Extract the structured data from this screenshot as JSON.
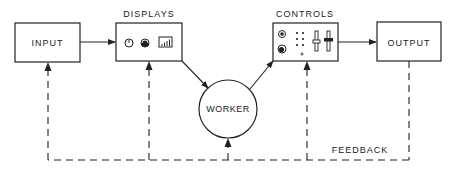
{
  "diagram": {
    "nodes": {
      "input": {
        "label": "INPUT"
      },
      "displays": {
        "label": "DISPLAYS",
        "icons": [
          "dial-gauge-icon",
          "meter-gauge-icon",
          "bar-graph-icon"
        ]
      },
      "worker": {
        "label": "WORKER"
      },
      "controls": {
        "label": "CONTROLS",
        "icons": [
          "knob-icon",
          "dial-knob-icon",
          "indicator-dots-icon",
          "slider-icon",
          "slider-icon"
        ]
      },
      "output": {
        "label": "OUTPUT"
      }
    },
    "edges": [
      {
        "from": "INPUT",
        "to": "DISPLAYS",
        "style": "solid"
      },
      {
        "from": "DISPLAYS",
        "to": "WORKER",
        "style": "solid"
      },
      {
        "from": "WORKER",
        "to": "CONTROLS",
        "style": "solid"
      },
      {
        "from": "CONTROLS",
        "to": "OUTPUT",
        "style": "solid"
      },
      {
        "from": "OUTPUT",
        "to": "INPUT, DISPLAYS, WORKER, CONTROLS",
        "style": "dashed",
        "label": "FEEDBACK"
      }
    ],
    "feedback_label": "FEEDBACK",
    "colors": {
      "stroke": "#222222",
      "background": "#ffffff"
    }
  }
}
